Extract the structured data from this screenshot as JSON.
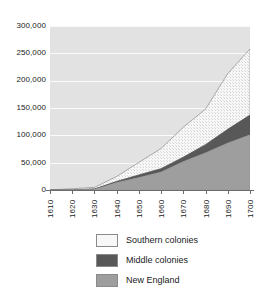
{
  "chart_data": {
    "type": "area",
    "stacked": true,
    "title": "",
    "subtitle": "",
    "xlabel": "",
    "ylabel": "",
    "x": [
      1610,
      1620,
      1630,
      1640,
      1650,
      1660,
      1670,
      1680,
      1690,
      1700
    ],
    "categories": [
      "1610",
      "1620",
      "1630",
      "1640",
      "1650",
      "1660",
      "1670",
      "1680",
      "1690",
      "1700"
    ],
    "series": [
      {
        "name": "New England",
        "color": "#9e9e9e",
        "values": [
          0,
          0,
          1500,
          13700,
          23000,
          33000,
          52000,
          68000,
          86000,
          101000
        ]
      },
      {
        "name": "Middle colonies",
        "color": "#585858",
        "values": [
          0,
          0,
          300,
          2000,
          4500,
          6000,
          8000,
          15000,
          25000,
          36000
        ]
      },
      {
        "name": "Southern colonies",
        "color": "#f2f2f2",
        "values": [
          350,
          2300,
          3000,
          9000,
          23000,
          37000,
          55000,
          65000,
          102000,
          121000
        ]
      }
    ],
    "stack_order_bottom_to_top": [
      "New England",
      "Middle colonies",
      "Southern colonies"
    ],
    "totals": [
      350,
      2300,
      4800,
      24700,
      50500,
      76000,
      115000,
      148000,
      213000,
      258000
    ],
    "ylim": [
      0,
      300000
    ],
    "xlim": [
      1610,
      1700
    ],
    "y_ticks": [
      0,
      50000,
      100000,
      150000,
      200000,
      250000,
      300000
    ],
    "y_tick_labels": [
      "0",
      "50,000",
      "100,000",
      "150,000",
      "200,000",
      "250,000",
      "300,000"
    ],
    "x_tick_labels": [
      "1610",
      "1620",
      "1630",
      "1640",
      "1650",
      "1660",
      "1670",
      "1680",
      "1690",
      "1700"
    ],
    "x_tick_rotation_degrees": 90,
    "grid": "horizontal",
    "gridline_color": "#fbfbfb",
    "plot_background": "#e2e2e2",
    "legend_position": "bottom",
    "legend": [
      {
        "label": "Southern colonies",
        "swatch": "#f7f7f7"
      },
      {
        "label": "Middle colonies",
        "swatch": "#585858"
      },
      {
        "label": "New England",
        "swatch": "#9e9e9e"
      }
    ]
  },
  "axes": {
    "y_labels": [
      "300,000",
      "250,000",
      "200,000",
      "150,000",
      "100,000",
      "50,000",
      "0"
    ],
    "x_labels": [
      "1610",
      "1620",
      "1630",
      "1640",
      "1650",
      "1660",
      "1670",
      "1680",
      "1690",
      "1700"
    ]
  },
  "colors": {
    "axis": "#6b6b6b",
    "text": "#1a1a1a",
    "panel": "#e2e2e2",
    "grid": "#fbfbfb",
    "new_england": "#9e9e9e",
    "middle_colonies": "#585858",
    "southern_colonies": "#f7f7f7",
    "series_outline": "#7d7d7d"
  }
}
